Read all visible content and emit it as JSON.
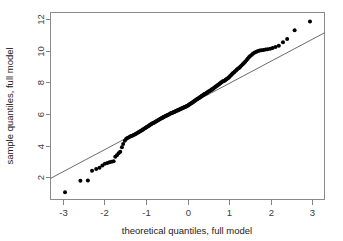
{
  "chart_data": {
    "type": "scatter",
    "title": "",
    "subtitle": "",
    "xlabel": "theoretical quantiles, full model",
    "ylabel": "sample quantiles, full model",
    "xlim": [
      -3.3,
      3.3
    ],
    "ylim": [
      0.6,
      12.4
    ],
    "xticks": [
      -3,
      -2,
      -1,
      0,
      1,
      2,
      3
    ],
    "xtick_labels": [
      "-3",
      "-2",
      "-1",
      "0",
      "1",
      "2",
      "3"
    ],
    "yticks": [
      2,
      4,
      6,
      8,
      10,
      12
    ],
    "ytick_labels": [
      "2",
      "4",
      "6",
      "8",
      "10",
      "12"
    ],
    "grid": false,
    "legend": null,
    "annotations": [],
    "marker": {
      "shape": "circle",
      "color": "#000000",
      "size": 2.0
    },
    "reference_line": {
      "name": "qq-line",
      "color": "#5a5a5a",
      "x": [
        -3.3,
        3.3
      ],
      "y": [
        1.93,
        11.12
      ]
    },
    "series": [
      {
        "name": "sample vs theoretical quantiles",
        "x": [
          -2.95,
          -2.58,
          -2.4,
          -2.3,
          -2.2,
          -2.12,
          -2.05,
          -1.99,
          -1.93,
          -1.88,
          -1.83,
          -1.78,
          -1.74,
          -1.7,
          -1.66,
          -1.62,
          -1.58,
          -1.55,
          -1.51,
          -1.48,
          -1.45,
          -1.42,
          -1.39,
          -1.36,
          -1.33,
          -1.3,
          -1.27,
          -1.25,
          -1.22,
          -1.19,
          -1.17,
          -1.14,
          -1.12,
          -1.09,
          -1.07,
          -1.05,
          -1.02,
          -1.0,
          -0.98,
          -0.95,
          -0.93,
          -0.91,
          -0.89,
          -0.87,
          -0.85,
          -0.83,
          -0.81,
          -0.79,
          -0.77,
          -0.75,
          -0.73,
          -0.71,
          -0.69,
          -0.67,
          -0.65,
          -0.63,
          -0.61,
          -0.59,
          -0.58,
          -0.56,
          -0.54,
          -0.52,
          -0.5,
          -0.48,
          -0.47,
          -0.45,
          -0.43,
          -0.41,
          -0.4,
          -0.38,
          -0.36,
          -0.34,
          -0.33,
          -0.31,
          -0.29,
          -0.28,
          -0.26,
          -0.24,
          -0.23,
          -0.21,
          -0.19,
          -0.18,
          -0.16,
          -0.14,
          -0.13,
          -0.11,
          -0.09,
          -0.08,
          -0.06,
          -0.04,
          -0.03,
          -0.01,
          0.01,
          0.03,
          0.04,
          0.06,
          0.08,
          0.09,
          0.11,
          0.13,
          0.14,
          0.16,
          0.18,
          0.19,
          0.21,
          0.23,
          0.24,
          0.26,
          0.28,
          0.29,
          0.31,
          0.33,
          0.34,
          0.36,
          0.38,
          0.4,
          0.41,
          0.43,
          0.45,
          0.47,
          0.48,
          0.5,
          0.52,
          0.54,
          0.56,
          0.58,
          0.59,
          0.61,
          0.63,
          0.65,
          0.67,
          0.69,
          0.71,
          0.73,
          0.75,
          0.77,
          0.79,
          0.81,
          0.83,
          0.85,
          0.87,
          0.89,
          0.91,
          0.93,
          0.95,
          0.98,
          1.0,
          1.02,
          1.05,
          1.07,
          1.09,
          1.12,
          1.14,
          1.17,
          1.19,
          1.22,
          1.25,
          1.27,
          1.3,
          1.33,
          1.36,
          1.39,
          1.42,
          1.45,
          1.48,
          1.51,
          1.55,
          1.58,
          1.62,
          1.66,
          1.7,
          1.74,
          1.78,
          1.83,
          1.88,
          1.93,
          1.99,
          2.05,
          2.12,
          2.2,
          2.3,
          2.4,
          2.58,
          2.95
        ],
        "y": [
          1.05,
          1.78,
          1.8,
          2.42,
          2.52,
          2.6,
          2.75,
          2.85,
          2.9,
          2.95,
          2.98,
          3.02,
          3.3,
          3.4,
          3.52,
          3.62,
          3.9,
          4.1,
          4.3,
          4.42,
          4.48,
          4.52,
          4.56,
          4.6,
          4.63,
          4.67,
          4.7,
          4.74,
          4.78,
          4.82,
          4.86,
          4.9,
          4.94,
          4.98,
          5.02,
          5.06,
          5.1,
          5.14,
          5.18,
          5.22,
          5.26,
          5.3,
          5.33,
          5.36,
          5.39,
          5.42,
          5.45,
          5.48,
          5.51,
          5.54,
          5.57,
          5.6,
          5.63,
          5.66,
          5.69,
          5.72,
          5.75,
          5.78,
          5.8,
          5.82,
          5.85,
          5.88,
          5.9,
          5.92,
          5.95,
          5.97,
          6.0,
          6.02,
          6.04,
          6.06,
          6.08,
          6.1,
          6.12,
          6.14,
          6.16,
          6.18,
          6.2,
          6.22,
          6.24,
          6.26,
          6.28,
          6.3,
          6.32,
          6.34,
          6.36,
          6.38,
          6.4,
          6.42,
          6.44,
          6.46,
          6.48,
          6.5,
          6.53,
          6.56,
          6.59,
          6.62,
          6.65,
          6.68,
          6.71,
          6.74,
          6.77,
          6.8,
          6.83,
          6.86,
          6.89,
          6.92,
          6.95,
          6.98,
          7.01,
          7.04,
          7.07,
          7.1,
          7.13,
          7.16,
          7.19,
          7.22,
          7.25,
          7.28,
          7.31,
          7.34,
          7.37,
          7.4,
          7.43,
          7.46,
          7.49,
          7.52,
          7.55,
          7.58,
          7.62,
          7.66,
          7.7,
          7.74,
          7.78,
          7.82,
          7.86,
          7.9,
          7.94,
          7.98,
          8.02,
          8.06,
          8.08,
          8.1,
          8.14,
          8.18,
          8.22,
          8.26,
          8.32,
          8.38,
          8.44,
          8.5,
          8.56,
          8.62,
          8.68,
          8.74,
          8.8,
          8.86,
          8.92,
          8.98,
          9.06,
          9.14,
          9.22,
          9.3,
          9.38,
          9.48,
          9.58,
          9.66,
          9.74,
          9.82,
          9.88,
          9.93,
          9.97,
          10.0,
          10.02,
          10.04,
          10.06,
          10.08,
          10.12,
          10.16,
          10.22,
          10.3,
          10.52,
          10.72,
          11.28,
          11.83
        ]
      }
    ]
  }
}
